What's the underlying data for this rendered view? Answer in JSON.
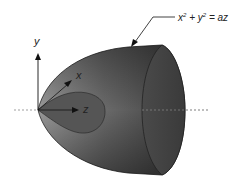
{
  "diagram": {
    "equation": {
      "x": "x",
      "y": "y",
      "rhs": "az",
      "plus": "+",
      "equals": "=",
      "exp": "2"
    },
    "axes": {
      "x_label": "x",
      "y_label": "y",
      "z_label": "z"
    },
    "colors": {
      "body_dark": "#3a3a3a",
      "body_light": "#8a8a8a",
      "inner": "#5a5a5a",
      "axis": "#111111",
      "dashed": "#777777"
    }
  }
}
